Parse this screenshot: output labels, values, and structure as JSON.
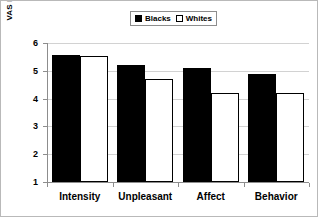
{
  "chart_data": {
    "type": "bar",
    "title": "",
    "xlabel": "",
    "ylabel": "VAS RATING",
    "ylim": [
      1,
      6
    ],
    "yticks": [
      1,
      2,
      3,
      4,
      5,
      6
    ],
    "grid": true,
    "legend_position": "top-center",
    "categories": [
      "Intensity",
      "Unpleasant",
      "Affect",
      "Behavior"
    ],
    "series": [
      {
        "name": "Blacks",
        "color": "#000000",
        "values": [
          5.57,
          5.21,
          5.1,
          4.87
        ]
      },
      {
        "name": "Whites",
        "color": "#ffffff",
        "values": [
          5.55,
          4.7,
          4.2,
          4.19
        ]
      }
    ]
  },
  "legend": {
    "entries": [
      {
        "label": "Blacks",
        "swatch": "filled-square-icon"
      },
      {
        "label": "Whites",
        "swatch": "open-square-icon"
      }
    ]
  },
  "axes": {
    "y_title": "VAS RATING",
    "y_tick_labels": [
      "6",
      "5",
      "4",
      "3",
      "2",
      "1"
    ],
    "x_tick_labels": [
      "Intensity",
      "Unpleasant",
      "Affect",
      "Behavior"
    ]
  },
  "colors": {
    "series_blacks": "#000000",
    "series_whites": "#ffffff",
    "axis": "#8d8d8d",
    "gridline": "#d2d2d2",
    "frame": "#b9b9b9",
    "text": "#000000"
  }
}
